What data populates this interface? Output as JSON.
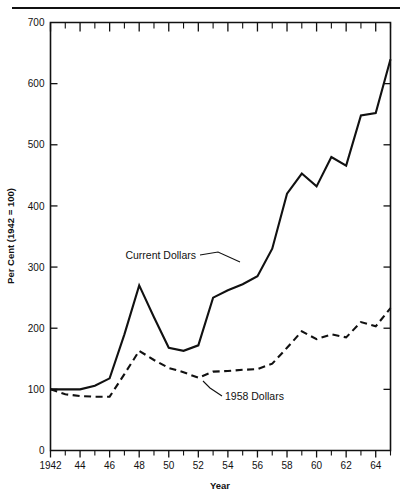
{
  "chart_data": {
    "type": "line",
    "title": "",
    "xlabel": "Year",
    "ylabel": "Per Cent (1942 = 100)",
    "xlim": [
      1942,
      1965
    ],
    "ylim": [
      0,
      700
    ],
    "grid": false,
    "legend_position": "inline-annotation",
    "y_ticks": [
      0,
      100,
      200,
      300,
      400,
      500,
      600,
      700
    ],
    "y_tick_labels": [
      "0",
      "100",
      "200",
      "300",
      "400",
      "500",
      "600",
      "700"
    ],
    "x_ticks": [
      1942,
      1943,
      1944,
      1945,
      1946,
      1947,
      1948,
      1949,
      1950,
      1951,
      1952,
      1953,
      1954,
      1955,
      1956,
      1957,
      1958,
      1959,
      1960,
      1961,
      1962,
      1963,
      1964,
      1965
    ],
    "x_tick_labels": [
      "1942",
      "",
      "44",
      "",
      "46",
      "",
      "48",
      "",
      "50",
      "",
      "52",
      "",
      "54",
      "",
      "56",
      "",
      "58",
      "",
      "60",
      "",
      "62",
      "",
      "64",
      ""
    ],
    "x": [
      1942,
      1943,
      1944,
      1945,
      1946,
      1947,
      1948,
      1949,
      1950,
      1951,
      1952,
      1953,
      1954,
      1955,
      1956,
      1957,
      1958,
      1959,
      1960,
      1961,
      1962,
      1963,
      1964,
      1965
    ],
    "series": [
      {
        "name": "Current Dollars",
        "style": "solid",
        "values": [
          100,
          100,
          100,
          106,
          118,
          190,
          270,
          218,
          168,
          163,
          172,
          250,
          262,
          272,
          285,
          330,
          420,
          453,
          432,
          480,
          466,
          548,
          552,
          640
        ]
      },
      {
        "name": "1958 Dollars",
        "style": "dashed",
        "values": [
          100,
          92,
          89,
          88,
          88,
          125,
          163,
          148,
          135,
          128,
          119,
          129,
          130,
          132,
          133,
          142,
          168,
          195,
          182,
          190,
          185,
          210,
          203,
          233
        ]
      }
    ],
    "annotations": [
      {
        "text": "Current Dollars",
        "series": "Current Dollars"
      },
      {
        "text": "1958 Dollars",
        "series": "1958 Dollars"
      }
    ]
  },
  "colors": {
    "ink": "#111111",
    "background": "#ffffff"
  }
}
